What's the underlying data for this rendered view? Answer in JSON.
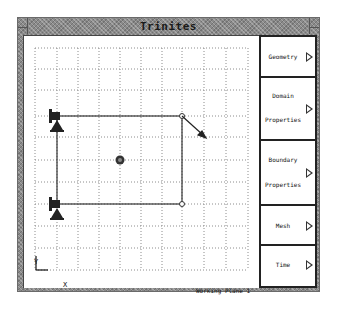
{
  "window": {
    "title": "Trinites"
  },
  "panel": {
    "buttons": [
      {
        "line1": "Geometry",
        "line2": "",
        "icon": "triangle-right-icon"
      },
      {
        "line1": "Domain",
        "line2": "Properties",
        "icon": "triangle-right-icon"
      },
      {
        "line1": "Boundary",
        "line2": "Properties",
        "icon": "triangle-right-icon"
      },
      {
        "line1": "Mesh",
        "line2": "",
        "icon": "triangle-right-icon"
      },
      {
        "line1": "Time",
        "line2": "",
        "icon": "triangle-right-icon"
      }
    ]
  },
  "canvas": {
    "working_plane_label": "Working Plane 1",
    "axis_x_label": "X",
    "axis_y_label": "Y",
    "grid": {
      "style": "dotted",
      "color": "#9a9a9a"
    },
    "rectangle": {
      "x1": 33,
      "y1": 80,
      "x2": 158,
      "y2": 168
    },
    "center_point": {
      "x": 96,
      "y": 124
    },
    "arrow": {
      "from": [
        158,
        80
      ],
      "to": [
        181,
        101
      ]
    },
    "fixed_supports": [
      "top-left",
      "bottom-left"
    ]
  }
}
